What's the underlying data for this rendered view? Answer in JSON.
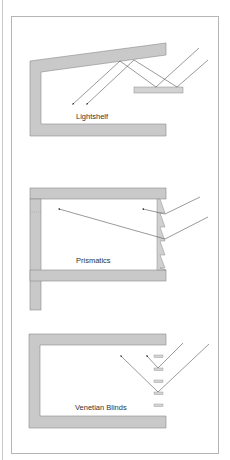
{
  "figure": {
    "colors": {
      "wall": "#c9c9c9",
      "wall_stroke": "#8a8a8a",
      "ray": "#555555",
      "frame": "#b5b5b5",
      "shelf": "#d2d2d2"
    },
    "panels": [
      {
        "id": "lightshelf",
        "label": "Lightshelf"
      },
      {
        "id": "prismatics",
        "label": "Prismatics"
      },
      {
        "id": "venetian-blinds",
        "label": "Venetian Blinds"
      }
    ]
  }
}
